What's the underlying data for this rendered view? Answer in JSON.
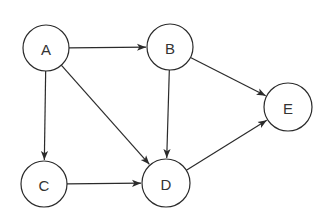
{
  "graph": {
    "type": "directed-graph",
    "nodes": [
      {
        "id": "A",
        "label": "A",
        "x": 46,
        "y": 48,
        "r": 23
      },
      {
        "id": "B",
        "label": "B",
        "x": 170,
        "y": 47,
        "r": 23
      },
      {
        "id": "C",
        "label": "C",
        "x": 44,
        "y": 184,
        "r": 23
      },
      {
        "id": "D",
        "label": "D",
        "x": 166,
        "y": 183,
        "r": 24
      },
      {
        "id": "E",
        "label": "E",
        "x": 288,
        "y": 107,
        "r": 24
      }
    ],
    "edges": [
      {
        "from": "A",
        "to": "B"
      },
      {
        "from": "A",
        "to": "C"
      },
      {
        "from": "A",
        "to": "D"
      },
      {
        "from": "B",
        "to": "D"
      },
      {
        "from": "B",
        "to": "E"
      },
      {
        "from": "C",
        "to": "D"
      },
      {
        "from": "D",
        "to": "E"
      }
    ]
  }
}
